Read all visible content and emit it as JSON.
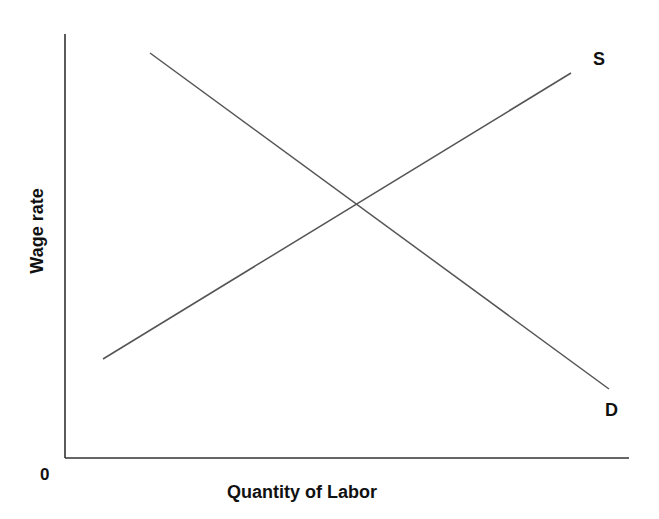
{
  "chart_data": {
    "type": "line",
    "title": "",
    "xlabel": "Quantity of Labor",
    "ylabel": "Wage rate",
    "origin_label": "0",
    "grid": false,
    "legend": null,
    "axis_ticks": false,
    "series": [
      {
        "name": "S",
        "description": "Labor supply curve (upward sloping)",
        "color": "#555555",
        "points_px": [
          [
            103,
            359
          ],
          [
            571,
            73
          ]
        ]
      },
      {
        "name": "D",
        "description": "Labor demand curve (downward sloping)",
        "color": "#555555",
        "points_px": [
          [
            150,
            53
          ],
          [
            609,
            389
          ]
        ]
      }
    ],
    "equilibrium_px": [
      357,
      204
    ],
    "axes_px": {
      "origin": [
        65,
        458
      ],
      "y_top": [
        65,
        34
      ],
      "x_right": [
        629,
        458
      ]
    }
  },
  "labels": {
    "supply": "S",
    "demand": "D",
    "origin": "0",
    "x_axis": "Quantity of Labor",
    "y_axis": "Wage rate"
  },
  "colors": {
    "axis": "#333333",
    "curve": "#555555",
    "text": "#111111"
  }
}
